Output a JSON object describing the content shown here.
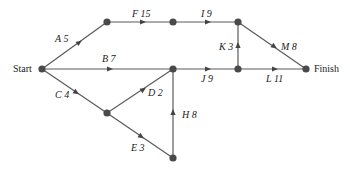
{
  "diagram": {
    "type": "activity-network",
    "terminals": {
      "start": "Start",
      "finish": "Finish"
    },
    "nodes": [
      {
        "id": "start",
        "x": 42,
        "y": 69
      },
      {
        "id": "n1",
        "x": 107,
        "y": 22
      },
      {
        "id": "n2",
        "x": 173,
        "y": 22
      },
      {
        "id": "n3",
        "x": 238,
        "y": 22
      },
      {
        "id": "n4",
        "x": 173,
        "y": 69
      },
      {
        "id": "n5",
        "x": 238,
        "y": 69
      },
      {
        "id": "finish",
        "x": 306,
        "y": 69
      },
      {
        "id": "n6",
        "x": 107,
        "y": 113
      },
      {
        "id": "n7",
        "x": 173,
        "y": 158
      }
    ],
    "edges": [
      {
        "activity": "A",
        "duration": "5",
        "label": "A 5",
        "from": "start",
        "to": "n1"
      },
      {
        "activity": "B",
        "duration": "7",
        "label": "B 7",
        "from": "start",
        "to": "n4"
      },
      {
        "activity": "C",
        "duration": "4",
        "label": "C 4",
        "from": "start",
        "to": "n6"
      },
      {
        "activity": "D",
        "duration": "2",
        "label": "D 2",
        "from": "n6",
        "to": "n4"
      },
      {
        "activity": "E",
        "duration": "3",
        "label": "E 3",
        "from": "n6",
        "to": "n7"
      },
      {
        "activity": "F",
        "duration": "15",
        "label": "F 15",
        "from": "n1",
        "to": "n2"
      },
      {
        "activity": "H",
        "duration": "8",
        "label": "H 8",
        "from": "n7",
        "to": "n4"
      },
      {
        "activity": "I",
        "duration": "9",
        "label": "I 9",
        "from": "n2",
        "to": "n3"
      },
      {
        "activity": "J",
        "duration": "9",
        "label": "J 9",
        "from": "n4",
        "to": "n5"
      },
      {
        "activity": "K",
        "duration": "3",
        "label": "K 3",
        "from": "n5",
        "to": "n3"
      },
      {
        "activity": "L",
        "duration": "11",
        "label": "L 11",
        "from": "n5",
        "to": "finish"
      },
      {
        "activity": "M",
        "duration": "8",
        "label": "M 8",
        "from": "n3",
        "to": "finish"
      }
    ]
  }
}
